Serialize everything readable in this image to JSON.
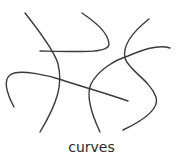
{
  "figure": {
    "caption": "curves",
    "stroke_color": "#3a3a3a",
    "background": "#ffffff",
    "curves": [
      {
        "name": "curve-a",
        "d": "M25,13 C40,32 55,52 58,64 C63,84 58,102 40,132"
      },
      {
        "name": "curve-b",
        "d": "M82,13 C95,22 108,32 109,44 C109,53 85,52 40,51"
      },
      {
        "name": "curve-c",
        "d": "M14,107 C6,92 4,80 10,75 C18,68 50,76 62,80 C80,86 105,93 128,101"
      },
      {
        "name": "curve-d",
        "d": "M149,19 C135,30 122,44 125,58 C128,70 150,80 156,97 C160,110 140,122 123,130"
      },
      {
        "name": "curve-e",
        "d": "M100,132 C92,115 86,95 91,84 C98,70 115,60 128,56 C142,50 158,44 170,48"
      }
    ]
  }
}
